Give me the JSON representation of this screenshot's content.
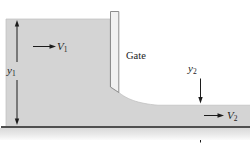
{
  "figure": {
    "labels": {
      "y1": {
        "base": "y",
        "sub": "1"
      },
      "v1": {
        "base": "V",
        "sub": "1"
      },
      "gate": "Gate",
      "y2": {
        "base": "y",
        "sub": "2"
      },
      "v2": {
        "base": "V",
        "sub": "2"
      }
    },
    "colors": {
      "water": "#d4d4d4",
      "water_edge": "#bdbdbd",
      "gate_fill": "#f1f1f1",
      "gate_border": "#8c8c8c",
      "ground_line": "#4f4f4f",
      "ground_band": "#d9d9d9",
      "arrow": "#1c1c1c",
      "background": "#ffffff"
    }
  }
}
